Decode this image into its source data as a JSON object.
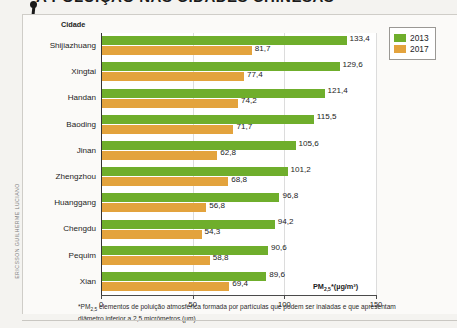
{
  "page": {
    "headline": "A POLUIÇÃO NAS CIDADES CHINESAS",
    "credit": "ERICSSON GUILHERME LUCIANO"
  },
  "chart_data": {
    "type": "bar",
    "orientation": "horizontal",
    "title": "",
    "xlabel": "PM2,5*(µg/m³)",
    "ylabel": "Cidade",
    "xlim": [
      0,
      150
    ],
    "xticks": [
      0,
      50,
      100,
      150
    ],
    "xtick_labels": [
      "0",
      "50",
      "100",
      "150"
    ],
    "grid": true,
    "legend_position": "top-right",
    "categories": [
      "Shijiazhuang",
      "Xingtai",
      "Handan",
      "Baoding",
      "Jinan",
      "Zhengzhou",
      "Huanggang",
      "Chengdu",
      "Pequim",
      "Xian"
    ],
    "series": [
      {
        "name": "2013",
        "color": "#6fae2c",
        "values": [
          133.4,
          129.6,
          121.4,
          115.5,
          105.6,
          101.2,
          96.8,
          94.2,
          90.6,
          89.6
        ],
        "labels": [
          "133,4",
          "129,6",
          "121,4",
          "115,5",
          "105,6",
          "101,2",
          "96,8",
          "94,2",
          "90,6",
          "89,6"
        ]
      },
      {
        "name": "2017",
        "color": "#e3a33d",
        "values": [
          81.7,
          77.4,
          74.2,
          71.7,
          62.8,
          68.8,
          56.8,
          54.3,
          58.8,
          69.4
        ],
        "labels": [
          "81,7",
          "77,4",
          "74,2",
          "71,7",
          "62,8",
          "68,8",
          "56,8",
          "54,3",
          "58,8",
          "69,4"
        ]
      }
    ],
    "footnote": "*PM2,5 elementos de poluição atmosférica formada por partículas que podem ser inaladas e que apresentam diâmetro inferior a 2,5 micrômetros (µm)."
  }
}
